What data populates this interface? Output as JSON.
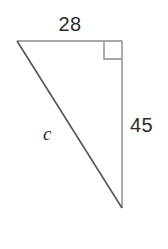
{
  "figure": {
    "kind": "right-triangle-diagram",
    "background_color": "#ffffff",
    "leg_line_color": "#8a8a8a",
    "hypotenuse_line_color": "#555555",
    "right_angle_marker_color": "#8a8a8a",
    "label_color": "#2b2b2b",
    "labels": {
      "top_leg": "28",
      "vertical_leg": "45",
      "hypotenuse": "c"
    },
    "geometry": {
      "top_left_vertex": [
        17,
        41
      ],
      "top_right_vertex": [
        122,
        41
      ],
      "bottom_vertex": [
        122,
        208
      ],
      "right_angle_marker": {
        "x": 104,
        "y": 41,
        "size": 18
      }
    }
  }
}
